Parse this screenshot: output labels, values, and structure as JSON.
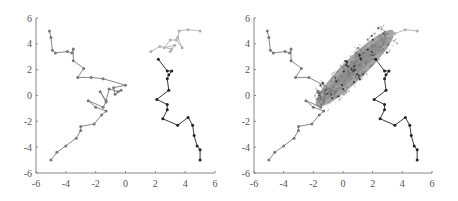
{
  "chart_data": [
    {
      "type": "line",
      "title": "",
      "xlabel": "",
      "ylabel": "",
      "xlim": [
        -6,
        6
      ],
      "ylim": [
        -6,
        6
      ],
      "xticks": [
        -6,
        -4,
        -2,
        0,
        2,
        4,
        6
      ],
      "yticks": [
        -6,
        -4,
        -2,
        0,
        2,
        4,
        6
      ],
      "xtick_labels": [
        "-6",
        "-4",
        "-2",
        "0",
        "2",
        "4",
        "6"
      ],
      "ytick_labels": [
        "-6",
        "-4",
        "-2",
        "0",
        "2",
        "4",
        "6"
      ],
      "grid": false,
      "legend": null,
      "series": [
        {
          "name": "trajectory-left",
          "color": "#7a7a7a",
          "points": [
            [
              -5.0,
              -5.0
            ],
            [
              -4.6,
              -4.4
            ],
            [
              -4.0,
              -3.9
            ],
            [
              -3.3,
              -3.3
            ],
            [
              -3.0,
              -2.7
            ],
            [
              -3.0,
              -2.4
            ],
            [
              -2.1,
              -2.2
            ],
            [
              -1.6,
              -1.5
            ],
            [
              -1.3,
              -1.2
            ],
            [
              -2.0,
              -0.9
            ],
            [
              -2.5,
              -0.4
            ],
            [
              -1.5,
              -0.9
            ],
            [
              -1.3,
              -0.5
            ],
            [
              -1.7,
              0.3
            ],
            [
              -1.3,
              -0.4
            ],
            [
              -1.1,
              0.5
            ],
            [
              -0.5,
              0.3
            ],
            [
              -0.3,
              0.4
            ],
            [
              -0.7,
              0.1
            ],
            [
              -0.8,
              0.6
            ],
            [
              0.0,
              0.8
            ],
            [
              -1.5,
              1.3
            ],
            [
              -2.3,
              1.4
            ],
            [
              -3.2,
              1.4
            ],
            [
              -2.8,
              2.1
            ],
            [
              -3.5,
              2.7
            ],
            [
              -3.5,
              3.6
            ],
            [
              -3.6,
              3.3
            ],
            [
              -3.9,
              3.4
            ],
            [
              -4.7,
              3.3
            ],
            [
              -4.9,
              3.5
            ],
            [
              -5.0,
              4.5
            ],
            [
              -5.1,
              5.0
            ]
          ]
        },
        {
          "name": "trajectory-right",
          "color": "#222222",
          "points": [
            [
              5.0,
              -5.0
            ],
            [
              5.0,
              -4.2
            ],
            [
              4.8,
              -3.9
            ],
            [
              4.6,
              -3.1
            ],
            [
              4.5,
              -2.3
            ],
            [
              4.2,
              -1.7
            ],
            [
              3.5,
              -2.3
            ],
            [
              2.5,
              -1.8
            ],
            [
              2.8,
              -1.1
            ],
            [
              2.8,
              -0.7
            ],
            [
              2.1,
              -0.3
            ],
            [
              2.9,
              0.4
            ],
            [
              2.8,
              1.3
            ],
            [
              2.9,
              1.6
            ],
            [
              3.1,
              1.9
            ],
            [
              2.8,
              1.9
            ],
            [
              2.2,
              2.8
            ]
          ]
        },
        {
          "name": "trajectory-top",
          "color": "#b0b0b0",
          "points": [
            [
              1.7,
              3.4
            ],
            [
              2.3,
              3.8
            ],
            [
              3.1,
              3.6
            ],
            [
              3.0,
              3.4
            ],
            [
              3.3,
              3.9
            ],
            [
              2.6,
              3.7
            ],
            [
              3.0,
              4.3
            ],
            [
              3.4,
              4.3
            ],
            [
              3.8,
              3.7
            ],
            [
              3.5,
              4.5
            ],
            [
              3.6,
              5.0
            ],
            [
              4.2,
              5.1
            ],
            [
              5.0,
              5.0
            ]
          ]
        }
      ]
    },
    {
      "type": "line",
      "title": "",
      "xlabel": "",
      "ylabel": "",
      "xlim": [
        -6,
        6
      ],
      "ylim": [
        -6,
        6
      ],
      "xticks": [
        -6,
        -4,
        -2,
        0,
        2,
        4,
        6
      ],
      "yticks": [
        -6,
        -4,
        -2,
        0,
        2,
        4,
        6
      ],
      "xtick_labels": [
        "-6",
        "-4",
        "-2",
        "0",
        "2",
        "4",
        "6"
      ],
      "ytick_labels": [
        "-6",
        "-4",
        "-2",
        "0",
        "2",
        "4",
        "6"
      ],
      "grid": false,
      "legend": null,
      "annotation": "Same three trajectories continued; all converge into a dense elongated cloud along the diagonal from about (-1.5,-0.5) to (3.3,4.8)",
      "cloud": {
        "from": [
          -1.6,
          -0.6
        ],
        "to": [
          3.2,
          4.8
        ],
        "half_width": 0.55,
        "color": "#8c8c8c"
      },
      "series": [
        {
          "name": "trajectory-left",
          "color": "#7a7a7a",
          "points": [
            [
              -5.0,
              -5.0
            ],
            [
              -4.6,
              -4.4
            ],
            [
              -4.0,
              -3.9
            ],
            [
              -3.3,
              -3.3
            ],
            [
              -3.0,
              -2.7
            ],
            [
              -3.0,
              -2.4
            ],
            [
              -2.1,
              -2.2
            ],
            [
              -1.6,
              -1.5
            ],
            [
              -1.3,
              -1.2
            ],
            [
              -2.0,
              -0.9
            ],
            [
              -2.5,
              -0.4
            ],
            [
              -1.5,
              -0.9
            ],
            [
              -1.3,
              -0.5
            ],
            [
              -1.7,
              0.3
            ],
            [
              -1.3,
              -0.4
            ],
            [
              -1.1,
              0.5
            ],
            [
              -0.5,
              0.3
            ],
            [
              -2.3,
              1.4
            ],
            [
              -3.2,
              1.4
            ],
            [
              -2.8,
              2.1
            ],
            [
              -3.5,
              2.7
            ],
            [
              -3.5,
              3.6
            ],
            [
              -3.6,
              3.3
            ],
            [
              -3.9,
              3.4
            ],
            [
              -4.7,
              3.3
            ],
            [
              -4.9,
              3.5
            ],
            [
              -5.0,
              4.5
            ],
            [
              -5.1,
              5.0
            ]
          ]
        },
        {
          "name": "trajectory-right",
          "color": "#222222",
          "points": [
            [
              5.0,
              -5.0
            ],
            [
              5.0,
              -4.2
            ],
            [
              4.8,
              -3.9
            ],
            [
              4.6,
              -3.1
            ],
            [
              4.5,
              -2.3
            ],
            [
              4.2,
              -1.7
            ],
            [
              3.5,
              -2.3
            ],
            [
              2.5,
              -1.8
            ],
            [
              2.8,
              -1.1
            ],
            [
              2.8,
              -0.7
            ],
            [
              2.1,
              -0.3
            ],
            [
              2.9,
              0.4
            ],
            [
              2.8,
              1.3
            ],
            [
              2.9,
              1.6
            ],
            [
              3.1,
              1.9
            ],
            [
              2.8,
              1.9
            ],
            [
              2.2,
              2.8
            ]
          ]
        },
        {
          "name": "trajectory-top",
          "color": "#b0b0b0",
          "points": [
            [
              3.0,
              4.6
            ],
            [
              3.5,
              4.8
            ],
            [
              4.2,
              5.1
            ],
            [
              5.0,
              5.0
            ]
          ]
        }
      ]
    }
  ]
}
